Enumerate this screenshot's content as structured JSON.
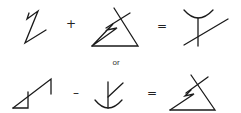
{
  "diagram": {
    "equations": [
      {
        "terms": [
          "glyph-z-zigzag",
          "glyph-triangle-crossed"
        ],
        "operator": "+",
        "equals": "=",
        "result": "glyph-cup-crossed"
      },
      {
        "terms": [
          "glyph-step-triangle",
          "glyph-anchor"
        ],
        "operator": "-",
        "equals": "=",
        "result": "glyph-triangle-crossed"
      }
    ],
    "connector": "or"
  },
  "labels": {
    "plus": "+",
    "minus": "–",
    "equals_1": "=",
    "equals_2": "=",
    "or": "or"
  },
  "colors": {
    "stroke": "#1a1a1a",
    "background": "#ffffff"
  }
}
